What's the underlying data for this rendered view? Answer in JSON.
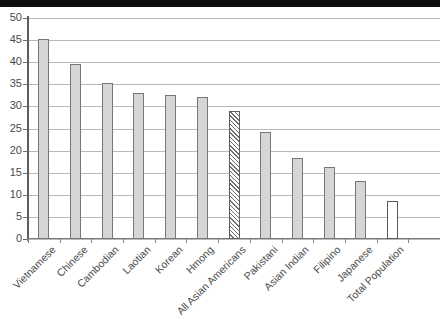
{
  "chart_data": {
    "type": "bar",
    "title": "",
    "subtitle": "",
    "xlabel": "",
    "ylabel": "",
    "ylim": [
      0,
      50
    ],
    "ytick_step": 5,
    "yticks": [
      50,
      45,
      40,
      35,
      30,
      25,
      20,
      15,
      10,
      5,
      0
    ],
    "grid": true,
    "legend": "none",
    "categories": [
      "Vietnamese",
      "Chinese",
      "Cambodian",
      "Laotian",
      "Korean",
      "Hmong",
      "All Asian Americans",
      "Pakistani",
      "Asian Indian",
      "Filipino",
      "Japanese",
      "Total Population"
    ],
    "values": [
      45.2,
      39.6,
      35.2,
      33.0,
      32.5,
      32.1,
      28.9,
      24.3,
      18.4,
      16.3,
      13.2,
      8.7
    ],
    "bar_styles": [
      "filled",
      "filled",
      "filled",
      "filled",
      "filled",
      "filled",
      "hatched",
      "filled",
      "filled",
      "filled",
      "filled",
      "open"
    ],
    "colors": {
      "bar_fill": "#d6d6d6",
      "bar_border": "#787878",
      "hatch_line": "#6f6f6f",
      "open_bar_fill": "#ffffff",
      "gridline": "#b9b9b9",
      "axis": "#5d5d5d",
      "text": "#4a4a4a"
    }
  }
}
